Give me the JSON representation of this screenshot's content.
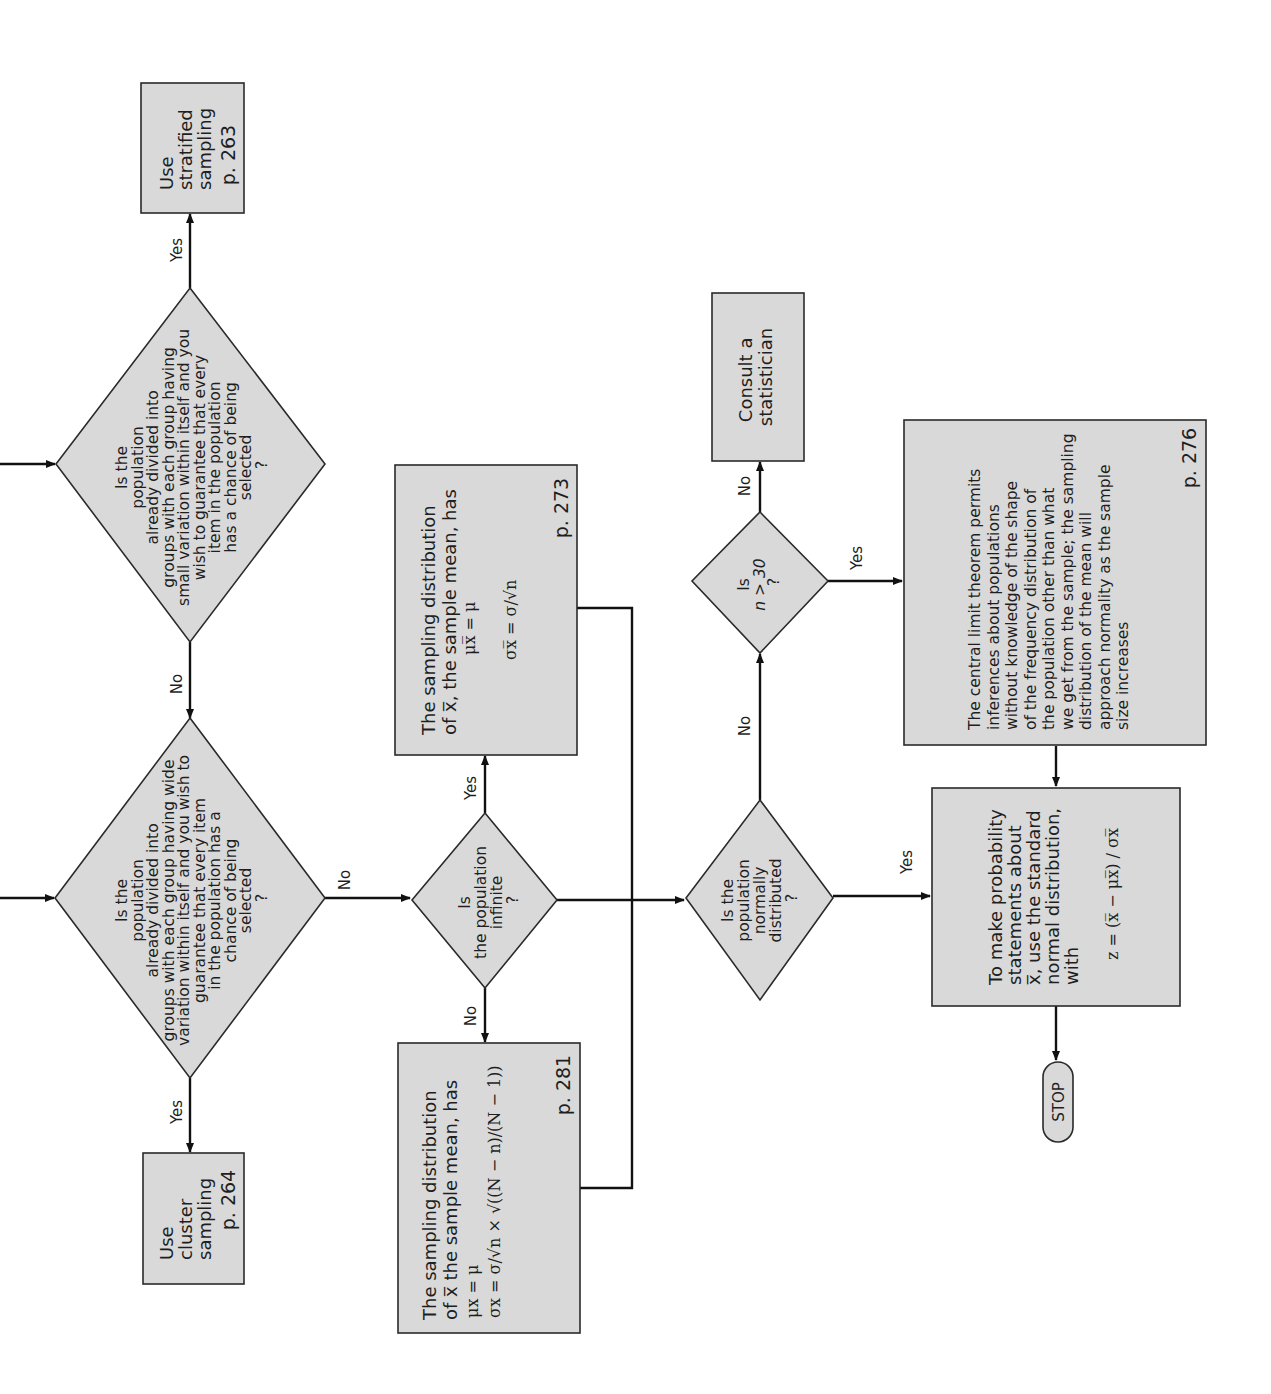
{
  "diagram": {
    "orientation": "rotated-90-ccw",
    "colors": {
      "box_fill": "#d9d9d9",
      "stroke": "#2a2a2a",
      "line": "#111111",
      "background": "#ffffff"
    },
    "nodes": {
      "stratified": {
        "type": "process",
        "lines": [
          "Use",
          "stratified",
          "sampling"
        ],
        "page": "p. 263"
      },
      "q_small_variation": {
        "type": "decision",
        "lines": [
          "Is the",
          "population",
          "already divided into",
          "groups with each group having",
          "small variation within itself and you",
          "wish to guarantee that every",
          "item in the population",
          "has a chance of being",
          "selected",
          "?"
        ]
      },
      "q_wide_variation": {
        "type": "decision",
        "lines": [
          "Is the",
          "population",
          "already divided into",
          "groups with each group having wide",
          "variation within itself and you wish to",
          "guarantee that every item",
          "in the population has a",
          "chance of being",
          "selected",
          "?"
        ]
      },
      "cluster": {
        "type": "process",
        "lines": [
          "Use",
          "cluster",
          "sampling"
        ],
        "page": "p. 264"
      },
      "infinite_box": {
        "type": "process",
        "lines": [
          "The sampling distribution",
          "of x̅, the sample mean, has"
        ],
        "formula1": "μx̅ = μ",
        "formula2": "σx̅ = σ/√n",
        "page": "p. 273"
      },
      "q_infinite": {
        "type": "decision",
        "lines": [
          "Is",
          "the population",
          "infinite",
          "?"
        ]
      },
      "finite_box": {
        "type": "process",
        "lines": [
          "The sampling distribution",
          "of x̅ the sample mean, has"
        ],
        "formula1": "μx = μ",
        "formula2": "σx = σ/√n × √((N − n)/(N − 1))",
        "page": "p. 281"
      },
      "consult": {
        "type": "process",
        "lines": [
          "Consult a",
          "statistician"
        ]
      },
      "q_n30": {
        "type": "decision",
        "lines": [
          "Is",
          "n > 30",
          "?"
        ]
      },
      "q_normal": {
        "type": "decision",
        "lines": [
          "Is the",
          "population",
          "normally",
          "distributed",
          "?"
        ]
      },
      "clt_box": {
        "type": "process",
        "lines": [
          "The central limit theorem permits",
          "inferences about populations",
          "without knowledge of the shape",
          "of the frequency distribution of",
          "the population other than what",
          "we get from the sample; the sampling",
          "distribution of the mean will",
          "approach normality as the sample",
          "size increases"
        ],
        "page": "p. 276"
      },
      "prob_box": {
        "type": "process",
        "lines": [
          "To make probability",
          "statements about",
          "x̅, use the standard",
          "normal distribution,",
          "with"
        ],
        "formula": "z = (x̅ − μx̅) / σx̅"
      },
      "stop": {
        "type": "terminator",
        "label": "STOP"
      }
    },
    "edge_labels": {
      "small_yes": "Yes",
      "small_no": "No",
      "wide_yes": "Yes",
      "wide_no": "No",
      "inf_yes": "Yes",
      "inf_no": "No",
      "normal_yes": "Yes",
      "normal_no": "No",
      "n30_yes": "Yes",
      "n30_no": "No"
    }
  }
}
